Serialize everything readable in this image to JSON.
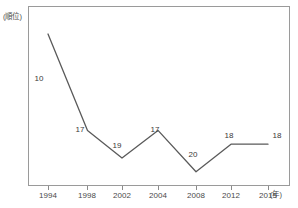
{
  "chart_data": {
    "type": "line",
    "title": "",
    "subtitle": "",
    "xlabel": "(年)",
    "ylabel": "(順位)",
    "grid": false,
    "legend": null,
    "categories": [
      "1994",
      "1998",
      "2002",
      "2004",
      "2008",
      "2012",
      "2015"
    ],
    "values": [
      10,
      17,
      19,
      17,
      20,
      18,
      18
    ],
    "data_labels": [
      "10",
      "17",
      "19",
      "17",
      "20",
      "18",
      "18"
    ],
    "series": [
      {
        "name": "順位",
        "values": [
          10,
          17,
          19,
          17,
          20,
          18,
          18
        ]
      }
    ],
    "y_axis_inverted": true,
    "ylim": [
      21,
      8
    ],
    "axis_units": {
      "y": "(順位)",
      "x": "(年)"
    },
    "tick_labels": {
      "x": [
        "1994",
        "1998",
        "2002",
        "2004",
        "2008",
        "2012",
        "2015"
      ],
      "y": []
    },
    "colors": {
      "line": "#5a5a5a",
      "frame": "#9a9a9a",
      "text": "#4a4a4a",
      "background": "#ffffff"
    }
  },
  "axis": {
    "y_unit_label": "(順位)",
    "x_unit_label": "(年)"
  },
  "ticks": [
    {
      "label": "1994",
      "value": 10,
      "data_label": "10"
    },
    {
      "label": "1998",
      "value": 17,
      "data_label": "17"
    },
    {
      "label": "2002",
      "value": 19,
      "data_label": "19"
    },
    {
      "label": "2004",
      "value": 17,
      "data_label": "17"
    },
    {
      "label": "2008",
      "value": 20,
      "data_label": "20"
    },
    {
      "label": "2012",
      "value": 18,
      "data_label": "18"
    },
    {
      "label": "2015",
      "value": 18,
      "data_label": "18"
    }
  ]
}
